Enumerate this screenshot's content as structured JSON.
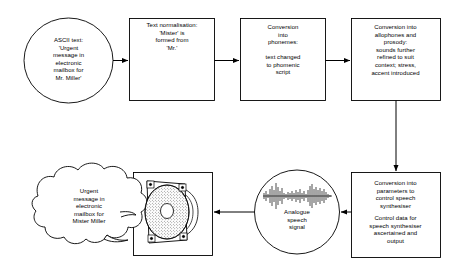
{
  "diagram": {
    "type": "flow-diagram",
    "stroke_color": "#000000",
    "fill_color": "#ffffff",
    "nodes": [
      {
        "id": "ascii-text",
        "shape": "ellipse",
        "text": "ASCII text:\n'Urgent\nmessage in\nelectronic\nmailbox for\nMr. Miller'"
      },
      {
        "id": "text-normalisation",
        "shape": "rect",
        "text": "Text normalisation:\n'Mister' is\nformed from\n'Mr.'"
      },
      {
        "id": "conversion-phonemes",
        "shape": "rect",
        "text_top": "Conversion\ninto\nphonemes:",
        "text_bottom": "text changed\nto phomenic\nscript"
      },
      {
        "id": "conversion-allophones",
        "shape": "rect",
        "text": "Conversion into\nallophones and\nprosody:\nsounds further\nrefined to suit\ncontext; stress,\naccent introduced"
      },
      {
        "id": "conversion-parameters",
        "shape": "rect",
        "text_top": "Conversion into\nparameters to\ncontrol speech\nsynthesiser",
        "text_bottom": "Control data for\nspeech synthesiser\nascertained and\noutput"
      },
      {
        "id": "analogue-speech-signal",
        "shape": "ellipse",
        "icon": "waveform-icon",
        "text": "Analogue\nspeech\nsignal"
      },
      {
        "id": "loudspeaker",
        "shape": "rect",
        "icon": "loudspeaker-icon",
        "text": ""
      },
      {
        "id": "heard-message",
        "shape": "cloud",
        "text": "Urgent\nmessage in\nelectronic\nmailbox for\nMister Miller"
      }
    ],
    "edges": [
      {
        "from": "ascii-text",
        "to": "text-normalisation",
        "direction": "right"
      },
      {
        "from": "text-normalisation",
        "to": "conversion-phonemes",
        "direction": "right"
      },
      {
        "from": "conversion-phonemes",
        "to": "conversion-allophones",
        "direction": "right"
      },
      {
        "from": "conversion-allophones",
        "to": "conversion-parameters",
        "direction": "down"
      },
      {
        "from": "conversion-parameters",
        "to": "analogue-speech-signal",
        "direction": "left"
      },
      {
        "from": "analogue-speech-signal",
        "to": "loudspeaker",
        "direction": "left"
      }
    ]
  }
}
